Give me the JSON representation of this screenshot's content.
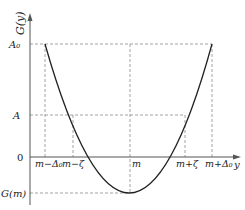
{
  "diagram": {
    "type": "parabola-function-plot",
    "y_axis_label": "G(y)",
    "x_axis_label": "y",
    "origin_label": "0",
    "y_levels": [
      {
        "key": "A0",
        "label": "A₀"
      },
      {
        "key": "A",
        "label": "A"
      },
      {
        "key": "Gm",
        "label": "G(m)"
      }
    ],
    "x_marks": [
      {
        "key": "m_minus_delta0",
        "label": "m−Δ₀"
      },
      {
        "key": "m_minus_zeta",
        "label": "m−ζ"
      },
      {
        "key": "m",
        "label": "m"
      },
      {
        "key": "m_plus_zeta",
        "label": "m+ζ"
      },
      {
        "key": "m_plus_delta0",
        "label": "m+Δ₀"
      }
    ],
    "colors": {
      "axis": "#555555",
      "curve": "#222222",
      "dashed": "#888888",
      "text": "#222222"
    }
  }
}
